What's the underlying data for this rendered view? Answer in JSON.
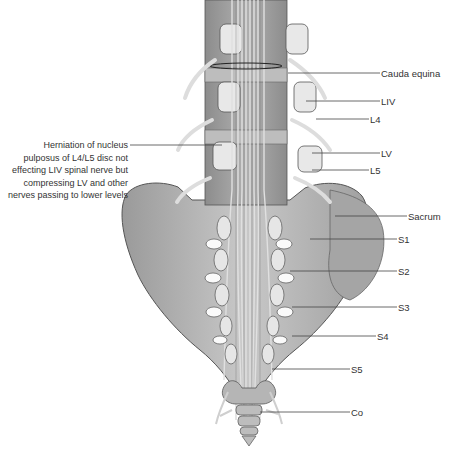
{
  "diagram": {
    "labels_right": [
      {
        "id": "cauda-equina",
        "text": "Cauda equina",
        "x": 381,
        "y": 68
      },
      {
        "id": "liv",
        "text": "LIV",
        "x": 381,
        "y": 96
      },
      {
        "id": "l4",
        "text": "L4",
        "x": 370,
        "y": 114
      },
      {
        "id": "lv",
        "text": "LV",
        "x": 381,
        "y": 148
      },
      {
        "id": "l5",
        "text": "L5",
        "x": 370,
        "y": 165
      },
      {
        "id": "sacrum",
        "text": "Sacrum",
        "x": 408,
        "y": 211
      },
      {
        "id": "s1",
        "text": "S1",
        "x": 398,
        "y": 234
      },
      {
        "id": "s2",
        "text": "S2",
        "x": 398,
        "y": 266
      },
      {
        "id": "s3",
        "text": "S3",
        "x": 398,
        "y": 302
      },
      {
        "id": "s4",
        "text": "S4",
        "x": 377,
        "y": 331
      },
      {
        "id": "s5",
        "text": "S5",
        "x": 351,
        "y": 364
      },
      {
        "id": "co",
        "text": "Co",
        "x": 351,
        "y": 407
      }
    ],
    "annotation_left": {
      "lines": [
        "Herniation of nucleus",
        "pulposus of L4/L5 disc not",
        "effecting LIV spinal nerve but",
        "compressing LV and other",
        "nerves passing to lower levels"
      ]
    },
    "colors": {
      "bone": "#b8b8b8",
      "bone_dark": "#8a8a8a",
      "nerve": "#d6d6d6",
      "outline": "#555555",
      "leader": "#444444",
      "text": "#333333"
    }
  }
}
